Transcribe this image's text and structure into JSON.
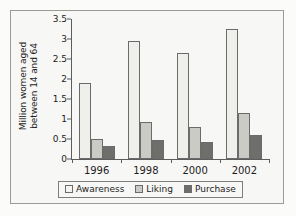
{
  "chart_data": {
    "type": "bar",
    "title": "",
    "xlabel": "",
    "ylabel": "Million women aged between 14 and 64",
    "ylabel_lines": [
      "Million women aged",
      "between 14 and 64"
    ],
    "ylim": [
      0,
      3.5
    ],
    "yticks": [
      "0",
      "0.5",
      "1",
      "1.5",
      "2",
      "2.5",
      "3",
      "3.5"
    ],
    "ytick_values": [
      0,
      0.5,
      1,
      1.5,
      2,
      2.5,
      3,
      3.5
    ],
    "grid": false,
    "legend_position": "bottom",
    "categories": [
      "1996",
      "1998",
      "2000",
      "2002"
    ],
    "series": [
      {
        "name": "Awareness",
        "color": "#efefeb",
        "values": [
          1.9,
          2.95,
          2.65,
          3.25
        ]
      },
      {
        "name": "Liking",
        "color": "#cbcbc6",
        "values": [
          0.5,
          0.92,
          0.8,
          1.15
        ]
      },
      {
        "name": "Purchase",
        "color": "#6e6e6b",
        "values": [
          0.32,
          0.48,
          0.43,
          0.6
        ]
      }
    ]
  }
}
